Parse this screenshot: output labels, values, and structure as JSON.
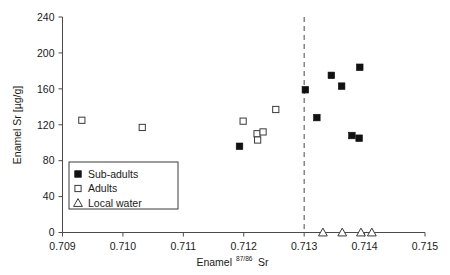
{
  "chart_data": {
    "type": "scatter",
    "title": "",
    "xlabel": "Enamel 87/86Sr",
    "xlabel_main": "Enamel",
    "xlabel_superscript": "87/86",
    "xlabel_suffix": "Sr",
    "ylabel": "Enamel Sr [µg/g]",
    "xlim": [
      0.709,
      0.715
    ],
    "ylim": [
      0,
      240
    ],
    "xticks": [
      "0.709",
      "0.710",
      "0.711",
      "0.712",
      "0.713",
      "0.714",
      "0.715"
    ],
    "xtick_values": [
      0.709,
      0.71,
      0.711,
      0.712,
      0.713,
      0.714,
      0.715
    ],
    "yticks": [
      "0",
      "40",
      "80",
      "120",
      "160",
      "200",
      "240"
    ],
    "ytick_values": [
      0,
      40,
      80,
      120,
      160,
      200,
      240
    ],
    "grid": false,
    "legend_position": "lower-left-inside",
    "annotations": [
      {
        "name": "local-water-threshold-line",
        "type": "vertical-dashed-line",
        "x": 0.713
      }
    ],
    "series": [
      {
        "name": "Sub-adults",
        "marker": "filled-square",
        "color": "#111111",
        "points": [
          {
            "x": 0.71193,
            "y": 96
          },
          {
            "x": 0.71302,
            "y": 159
          },
          {
            "x": 0.71321,
            "y": 128
          },
          {
            "x": 0.71345,
            "y": 175
          },
          {
            "x": 0.71362,
            "y": 163
          },
          {
            "x": 0.71392,
            "y": 184
          },
          {
            "x": 0.71379,
            "y": 108
          },
          {
            "x": 0.71391,
            "y": 105
          }
        ]
      },
      {
        "name": "Adults",
        "marker": "open-square",
        "color": "#ffffff",
        "points": [
          {
            "x": 0.70932,
            "y": 125
          },
          {
            "x": 0.71032,
            "y": 117
          },
          {
            "x": 0.71199,
            "y": 124
          },
          {
            "x": 0.71222,
            "y": 110
          },
          {
            "x": 0.71232,
            "y": 112
          },
          {
            "x": 0.71223,
            "y": 103
          },
          {
            "x": 0.71253,
            "y": 137
          }
        ]
      },
      {
        "name": "Local water",
        "marker": "open-triangle",
        "color": "#ffffff",
        "points": [
          {
            "x": 0.71331,
            "y": 0
          },
          {
            "x": 0.71363,
            "y": 0
          },
          {
            "x": 0.71394,
            "y": 0
          },
          {
            "x": 0.71412,
            "y": 0
          }
        ]
      }
    ],
    "legend": [
      {
        "label": "Sub-adults",
        "marker": "filled-square"
      },
      {
        "label": "Adults",
        "marker": "open-square"
      },
      {
        "label": "Local water",
        "marker": "open-triangle"
      }
    ]
  }
}
